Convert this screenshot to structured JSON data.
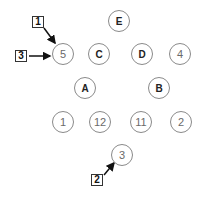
{
  "diagram": {
    "nodes": [
      {
        "id": "E",
        "label": "E",
        "kind": "letter",
        "x": 119,
        "y": 21
      },
      {
        "id": "5",
        "label": "5",
        "kind": "number",
        "x": 63,
        "y": 54
      },
      {
        "id": "C",
        "label": "C",
        "kind": "letter",
        "x": 99,
        "y": 54
      },
      {
        "id": "D",
        "label": "D",
        "kind": "letter",
        "x": 142,
        "y": 54
      },
      {
        "id": "4",
        "label": "4",
        "kind": "number",
        "x": 180,
        "y": 54
      },
      {
        "id": "A",
        "label": "A",
        "kind": "letter",
        "x": 85,
        "y": 88
      },
      {
        "id": "B",
        "label": "B",
        "kind": "letter",
        "x": 159,
        "y": 88
      },
      {
        "id": "1",
        "label": "1",
        "kind": "number",
        "x": 63,
        "y": 122
      },
      {
        "id": "12",
        "label": "12",
        "kind": "number",
        "x": 100,
        "y": 122
      },
      {
        "id": "11",
        "label": "11",
        "kind": "number",
        "x": 141,
        "y": 122
      },
      {
        "id": "2",
        "label": "2",
        "kind": "number",
        "x": 181,
        "y": 122
      },
      {
        "id": "3",
        "label": "3",
        "kind": "number",
        "x": 122,
        "y": 155
      }
    ],
    "callouts": [
      {
        "id": "callout-1",
        "label": "1",
        "x": 38,
        "y": 22,
        "arrow": {
          "x1": 44,
          "y1": 28,
          "x2": 55,
          "y2": 43
        }
      },
      {
        "id": "callout-3",
        "label": "3",
        "x": 21,
        "y": 56,
        "arrow": {
          "x1": 29,
          "y1": 56,
          "x2": 50,
          "y2": 56
        }
      },
      {
        "id": "callout-2",
        "label": "2",
        "x": 97,
        "y": 180,
        "arrow": {
          "x1": 104,
          "y1": 175,
          "x2": 114,
          "y2": 163
        }
      }
    ],
    "colors": {
      "node_border": "#8a8a8a",
      "number_text": "#6a6a6a",
      "letter_text": "#222222",
      "callout_border": "#333333",
      "arrow": "#111111"
    }
  }
}
